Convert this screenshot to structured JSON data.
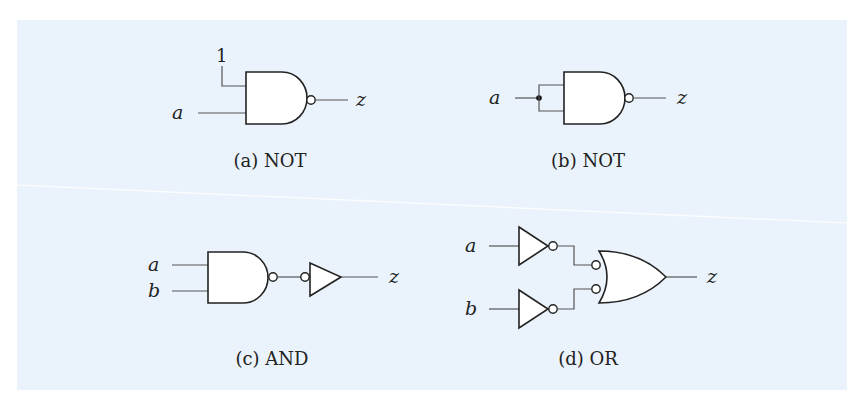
{
  "figure": {
    "background_color": "#eaf3fb",
    "subfigures": [
      {
        "id": "a",
        "caption": "(a) NOT",
        "description": "NAND gate with one input tied to constant 1",
        "inputs": [
          "1",
          "a"
        ],
        "output": "z",
        "gates": [
          "NAND"
        ]
      },
      {
        "id": "b",
        "caption": "(b) NOT",
        "description": "NAND gate with both inputs tied together to a",
        "inputs": [
          "a"
        ],
        "output": "z",
        "gates": [
          "NAND"
        ]
      },
      {
        "id": "c",
        "caption": "(c) AND",
        "description": "NAND gate followed by an inverter (bubble-input buffer)",
        "inputs": [
          "a",
          "b"
        ],
        "output": "z",
        "gates": [
          "NAND",
          "NOT"
        ]
      },
      {
        "id": "d",
        "caption": "(d) OR",
        "description": "Two inverters feeding an OR gate with inverted inputs (NAND)",
        "inputs": [
          "a",
          "b"
        ],
        "output": "z",
        "gates": [
          "NOT",
          "NOT",
          "OR-with-inverted-inputs"
        ]
      }
    ]
  },
  "labels": {
    "a": {
      "one": "1",
      "in": "a",
      "out": "z"
    },
    "b": {
      "in": "a",
      "out": "z"
    },
    "c": {
      "in1": "a",
      "in2": "b",
      "out": "z"
    },
    "d": {
      "in1": "a",
      "in2": "b",
      "out": "z"
    }
  },
  "captions": {
    "a": "(a) NOT",
    "b": "(b) NOT",
    "c": "(c) AND",
    "d": "(d) OR"
  }
}
